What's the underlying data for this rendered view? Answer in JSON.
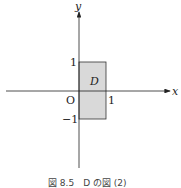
{
  "diagram": {
    "axes": {
      "x_label": "x",
      "y_label": "y",
      "origin_label": "O"
    },
    "ticks": {
      "x_one": "1",
      "y_one": "1",
      "y_minus_one": "−1"
    },
    "region": {
      "label": "D",
      "x_range": [
        0,
        1
      ],
      "y_range": [
        -1,
        1
      ],
      "fill": "#d9d9d9"
    },
    "caption": "図 8.5　D の図 (2)"
  }
}
